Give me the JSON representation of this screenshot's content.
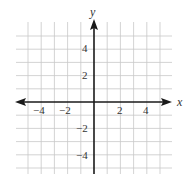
{
  "chart_data": {
    "type": "scatter",
    "title": "",
    "xlabel": "x",
    "ylabel": "y",
    "xlim": [
      -6,
      6
    ],
    "ylim": [
      -5.5,
      6
    ],
    "grid": true,
    "x_ticks": [
      -4,
      -2,
      2,
      4
    ],
    "y_ticks": [
      4,
      2,
      -2,
      -4
    ],
    "x_tick_labels": [
      "−4",
      "−2",
      "2",
      "4"
    ],
    "y_tick_labels": [
      "4",
      "2",
      "−2",
      "−4"
    ],
    "series": []
  },
  "colors": {
    "grid": "#c8c8c8",
    "axis": "#1a1a1a",
    "text": "#333333"
  }
}
